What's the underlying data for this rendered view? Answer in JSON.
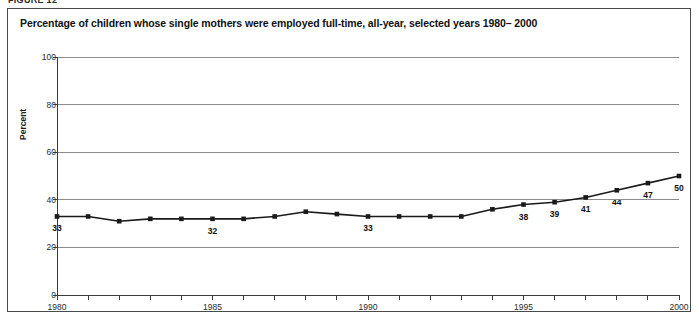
{
  "figure_label": "FIGURE 12",
  "chart_title": "Percentage of children whose single mothers were employed full-time, all-year, selected years 1980– 2000",
  "colors": {
    "frame": "#4a4a4a",
    "gridline": "#8c8c8c",
    "axis": "#3a3a3a",
    "series": "#1a1a1a",
    "background": "#ffffff"
  },
  "chart_data": {
    "type": "line",
    "title": "Percentage of children whose single mothers were employed full-time, all-year, selected years 1980– 2000",
    "xlabel": "",
    "ylabel": "Percent",
    "ylim": [
      0,
      100
    ],
    "xlim": [
      1980,
      2000
    ],
    "yticks": [
      0,
      20,
      40,
      60,
      80,
      100
    ],
    "ytick_labels": [
      "0",
      "20",
      "40",
      "60",
      "80",
      "100"
    ],
    "xticks": [
      1980,
      1981,
      1982,
      1983,
      1984,
      1985,
      1986,
      1987,
      1988,
      1989,
      1990,
      1991,
      1992,
      1993,
      1994,
      1995,
      1996,
      1997,
      1998,
      1999,
      2000
    ],
    "xtick_labels_shown": [
      "1980",
      "1985",
      "1990",
      "1995",
      "2000"
    ],
    "xtick_label_years": [
      1980,
      1985,
      1990,
      1995,
      2000
    ],
    "grid": "horizontal",
    "legend": "none",
    "marker": "square",
    "x": [
      1980,
      1981,
      1982,
      1983,
      1984,
      1985,
      1986,
      1987,
      1988,
      1989,
      1990,
      1991,
      1992,
      1993,
      1994,
      1995,
      1996,
      1997,
      1998,
      1999,
      2000
    ],
    "values": [
      33,
      33,
      31,
      32,
      32,
      32,
      32,
      33,
      35,
      34,
      33,
      33,
      33,
      33,
      36,
      38,
      39,
      41,
      44,
      47,
      50
    ],
    "point_labels": [
      {
        "year": 1980,
        "value": 33,
        "text": "33"
      },
      {
        "year": 1985,
        "value": 32,
        "text": "32"
      },
      {
        "year": 1990,
        "value": 33,
        "text": "33"
      },
      {
        "year": 1995,
        "value": 38,
        "text": "38"
      },
      {
        "year": 1996,
        "value": 39,
        "text": "39"
      },
      {
        "year": 1997,
        "value": 41,
        "text": "41"
      },
      {
        "year": 1998,
        "value": 44,
        "text": "44"
      },
      {
        "year": 1999,
        "value": 47,
        "text": "47"
      },
      {
        "year": 2000,
        "value": 50,
        "text": "50"
      }
    ]
  }
}
